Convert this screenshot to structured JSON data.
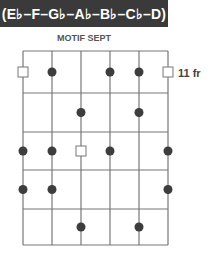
{
  "header": {
    "scale": "(E♭–F–G♭–A♭–B♭–C♭–D)"
  },
  "diagram": {
    "title": "MOTIF SEPT",
    "fret_label": "11 fr",
    "strings_x": [
      23,
      52,
      81,
      110,
      139,
      168
    ],
    "frets_y": [
      51,
      93,
      132,
      170,
      209,
      245
    ],
    "colors": {
      "line": "#777777",
      "dot": "#3d3d3d",
      "banner": "#3a3a3a"
    },
    "markers": [
      {
        "row": 0,
        "string": 0,
        "type": "square"
      },
      {
        "row": 0,
        "string": 1,
        "type": "dot"
      },
      {
        "row": 0,
        "string": 3,
        "type": "dot"
      },
      {
        "row": 0,
        "string": 4,
        "type": "dot"
      },
      {
        "row": 0,
        "string": 5,
        "type": "square"
      },
      {
        "row": 1,
        "string": 2,
        "type": "dot"
      },
      {
        "row": 1,
        "string": 4,
        "type": "dot"
      },
      {
        "row": 2,
        "string": 0,
        "type": "dot"
      },
      {
        "row": 2,
        "string": 1,
        "type": "dot"
      },
      {
        "row": 2,
        "string": 2,
        "type": "square"
      },
      {
        "row": 2,
        "string": 3,
        "type": "dot"
      },
      {
        "row": 2,
        "string": 5,
        "type": "dot"
      },
      {
        "row": 3,
        "string": 0,
        "type": "dot"
      },
      {
        "row": 3,
        "string": 1,
        "type": "dot"
      },
      {
        "row": 3,
        "string": 5,
        "type": "dot"
      },
      {
        "row": 4,
        "string": 2,
        "type": "dot"
      },
      {
        "row": 4,
        "string": 4,
        "type": "dot"
      }
    ]
  }
}
